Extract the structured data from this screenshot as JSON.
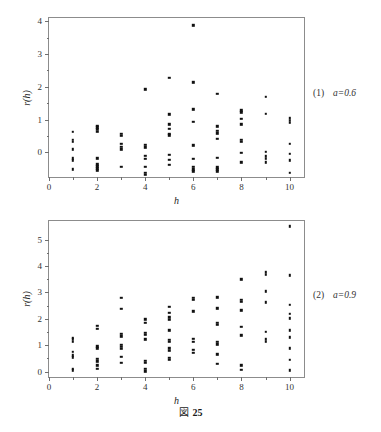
{
  "caption": {
    "prefix": "図",
    "number": "25"
  },
  "panels": [
    {
      "note_index": "(1)",
      "note_param": "a=0.6",
      "axis": {
        "xlabel": "h",
        "ylabel": "r(h)",
        "xticks": [
          "0",
          "2",
          "4",
          "6",
          "8",
          "10"
        ],
        "yticks": [
          "0",
          "1",
          "2",
          "3",
          "4"
        ]
      }
    },
    {
      "note_index": "(2)",
      "note_param": "a=0.9",
      "axis": {
        "xlabel": "h",
        "ylabel": "r(h)",
        "xticks": [
          "0",
          "2",
          "4",
          "6",
          "8",
          "10"
        ],
        "yticks": [
          "0",
          "1",
          "2",
          "3",
          "4",
          "5"
        ]
      }
    }
  ],
  "chart_data": [
    {
      "type": "scatter",
      "title": "",
      "subtitle": "(1)  a=0.6",
      "xlabel": "h",
      "ylabel": "r(h)",
      "xlim": [
        0,
        10.6
      ],
      "ylim": [
        -0.75,
        4.1
      ],
      "xticks": [
        0,
        2,
        4,
        6,
        8,
        10
      ],
      "yticks": [
        0,
        1,
        2,
        3,
        4
      ],
      "grid": false,
      "legend": null,
      "marker": "square",
      "marker_color": "#111111",
      "points": [
        {
          "x": 1,
          "y": 0.62
        },
        {
          "x": 1,
          "y": 0.38
        },
        {
          "x": 1,
          "y": 0.32
        },
        {
          "x": 1,
          "y": 0.1
        },
        {
          "x": 1,
          "y": -0.18
        },
        {
          "x": 1,
          "y": -0.24
        },
        {
          "x": 1,
          "y": -0.52
        },
        {
          "x": 2,
          "y": 0.82
        },
        {
          "x": 2,
          "y": 0.76
        },
        {
          "x": 2,
          "y": 0.7
        },
        {
          "x": 2,
          "y": 0.62
        },
        {
          "x": 2,
          "y": -0.18
        },
        {
          "x": 2,
          "y": -0.36
        },
        {
          "x": 2,
          "y": -0.42
        },
        {
          "x": 2,
          "y": -0.48
        },
        {
          "x": 2,
          "y": -0.54
        },
        {
          "x": 3,
          "y": 0.56
        },
        {
          "x": 3,
          "y": 0.5
        },
        {
          "x": 3,
          "y": 0.26
        },
        {
          "x": 3,
          "y": 0.18
        },
        {
          "x": 3,
          "y": 0.1
        },
        {
          "x": 3,
          "y": -0.44
        },
        {
          "x": 4,
          "y": 1.92
        },
        {
          "x": 4,
          "y": 0.24
        },
        {
          "x": 4,
          "y": 0.16
        },
        {
          "x": 4,
          "y": -0.1
        },
        {
          "x": 4,
          "y": -0.2
        },
        {
          "x": 4,
          "y": -0.44
        },
        {
          "x": 4,
          "y": -0.62
        },
        {
          "x": 4,
          "y": -0.68
        },
        {
          "x": 5,
          "y": 2.28
        },
        {
          "x": 5,
          "y": 1.16
        },
        {
          "x": 5,
          "y": 0.86
        },
        {
          "x": 5,
          "y": 0.72
        },
        {
          "x": 5,
          "y": 0.56
        },
        {
          "x": 5,
          "y": 0.52
        },
        {
          "x": 5,
          "y": -0.08
        },
        {
          "x": 5,
          "y": -0.22
        },
        {
          "x": 5,
          "y": -0.38
        },
        {
          "x": 6,
          "y": 3.88
        },
        {
          "x": 6,
          "y": 2.14
        },
        {
          "x": 6,
          "y": 1.32
        },
        {
          "x": 6,
          "y": 0.94
        },
        {
          "x": 6,
          "y": 0.22
        },
        {
          "x": 6,
          "y": -0.2
        },
        {
          "x": 6,
          "y": -0.44
        },
        {
          "x": 6,
          "y": -0.52
        },
        {
          "x": 6,
          "y": -0.58
        },
        {
          "x": 7,
          "y": 1.78
        },
        {
          "x": 7,
          "y": 0.8
        },
        {
          "x": 7,
          "y": 0.66
        },
        {
          "x": 7,
          "y": 0.58
        },
        {
          "x": 7,
          "y": 0.42
        },
        {
          "x": 7,
          "y": -0.16
        },
        {
          "x": 7,
          "y": -0.46
        },
        {
          "x": 7,
          "y": -0.52
        },
        {
          "x": 7,
          "y": -0.58
        },
        {
          "x": 8,
          "y": 1.28
        },
        {
          "x": 8,
          "y": 1.22
        },
        {
          "x": 8,
          "y": 1.02
        },
        {
          "x": 8,
          "y": 0.86
        },
        {
          "x": 8,
          "y": 0.38
        },
        {
          "x": 8,
          "y": 0.32
        },
        {
          "x": 8,
          "y": -0.02
        },
        {
          "x": 8,
          "y": -0.3
        },
        {
          "x": 9,
          "y": 1.7
        },
        {
          "x": 9,
          "y": 1.18
        },
        {
          "x": 9,
          "y": 0.02
        },
        {
          "x": 9,
          "y": -0.12
        },
        {
          "x": 9,
          "y": -0.2
        },
        {
          "x": 9,
          "y": -0.3
        },
        {
          "x": 10,
          "y": 1.04
        },
        {
          "x": 10,
          "y": 0.96
        },
        {
          "x": 10,
          "y": 0.9
        },
        {
          "x": 10,
          "y": 0.26
        },
        {
          "x": 10,
          "y": -0.04
        },
        {
          "x": 10,
          "y": -0.24
        },
        {
          "x": 10,
          "y": -0.62
        }
      ]
    },
    {
      "type": "scatter",
      "title": "",
      "subtitle": "(2)  a=0.9",
      "xlabel": "h",
      "ylabel": "r(h)",
      "xlim": [
        0,
        10.6
      ],
      "ylim": [
        -0.2,
        5.7
      ],
      "xticks": [
        0,
        2,
        4,
        6,
        8,
        10
      ],
      "yticks": [
        0,
        1,
        2,
        3,
        4,
        5
      ],
      "grid": false,
      "legend": null,
      "marker": "square",
      "marker_color": "#111111",
      "points": [
        {
          "x": 1,
          "y": 1.28
        },
        {
          "x": 1,
          "y": 1.22
        },
        {
          "x": 1,
          "y": 1.14
        },
        {
          "x": 1,
          "y": 0.76
        },
        {
          "x": 1,
          "y": 0.62
        },
        {
          "x": 1,
          "y": 0.54
        },
        {
          "x": 1,
          "y": 0.12
        },
        {
          "x": 1,
          "y": 0.06
        },
        {
          "x": 2,
          "y": 1.74
        },
        {
          "x": 2,
          "y": 1.62
        },
        {
          "x": 2,
          "y": 0.96
        },
        {
          "x": 2,
          "y": 0.88
        },
        {
          "x": 2,
          "y": 0.48
        },
        {
          "x": 2,
          "y": 0.4
        },
        {
          "x": 2,
          "y": 0.24
        },
        {
          "x": 2,
          "y": 0.12
        },
        {
          "x": 3,
          "y": 2.8
        },
        {
          "x": 3,
          "y": 2.38
        },
        {
          "x": 3,
          "y": 1.44
        },
        {
          "x": 3,
          "y": 1.34
        },
        {
          "x": 3,
          "y": 1.02
        },
        {
          "x": 3,
          "y": 0.94
        },
        {
          "x": 3,
          "y": 0.86
        },
        {
          "x": 3,
          "y": 0.56
        },
        {
          "x": 3,
          "y": 0.34
        },
        {
          "x": 4,
          "y": 1.98
        },
        {
          "x": 4,
          "y": 1.86
        },
        {
          "x": 4,
          "y": 1.48
        },
        {
          "x": 4,
          "y": 1.4
        },
        {
          "x": 4,
          "y": 1.22
        },
        {
          "x": 4,
          "y": 0.42
        },
        {
          "x": 4,
          "y": 0.34
        },
        {
          "x": 4,
          "y": 0.1
        },
        {
          "x": 4,
          "y": 0.02
        },
        {
          "x": 5,
          "y": 2.46
        },
        {
          "x": 5,
          "y": 2.22
        },
        {
          "x": 5,
          "y": 2.06
        },
        {
          "x": 5,
          "y": 1.96
        },
        {
          "x": 5,
          "y": 1.56
        },
        {
          "x": 5,
          "y": 1.2
        },
        {
          "x": 5,
          "y": 1.12
        },
        {
          "x": 5,
          "y": 0.88
        },
        {
          "x": 5,
          "y": 0.78
        },
        {
          "x": 5,
          "y": 0.52
        },
        {
          "x": 5,
          "y": 0.46
        },
        {
          "x": 6,
          "y": 2.8
        },
        {
          "x": 6,
          "y": 2.72
        },
        {
          "x": 6,
          "y": 2.28
        },
        {
          "x": 6,
          "y": 1.24
        },
        {
          "x": 6,
          "y": 1.14
        },
        {
          "x": 6,
          "y": 0.84
        },
        {
          "x": 6,
          "y": 0.72
        },
        {
          "x": 7,
          "y": 2.82
        },
        {
          "x": 7,
          "y": 2.4
        },
        {
          "x": 7,
          "y": 1.86
        },
        {
          "x": 7,
          "y": 1.78
        },
        {
          "x": 7,
          "y": 1.12
        },
        {
          "x": 7,
          "y": 1.04
        },
        {
          "x": 7,
          "y": 0.66
        },
        {
          "x": 7,
          "y": 0.3
        },
        {
          "x": 8,
          "y": 3.5
        },
        {
          "x": 8,
          "y": 2.72
        },
        {
          "x": 8,
          "y": 2.64
        },
        {
          "x": 8,
          "y": 2.32
        },
        {
          "x": 8,
          "y": 1.7
        },
        {
          "x": 8,
          "y": 1.38
        },
        {
          "x": 8,
          "y": 0.24
        },
        {
          "x": 8,
          "y": 0.08
        },
        {
          "x": 9,
          "y": 3.76
        },
        {
          "x": 9,
          "y": 3.66
        },
        {
          "x": 9,
          "y": 3.04
        },
        {
          "x": 9,
          "y": 2.62
        },
        {
          "x": 9,
          "y": 1.5
        },
        {
          "x": 9,
          "y": 1.22
        },
        {
          "x": 9,
          "y": 1.14
        },
        {
          "x": 10,
          "y": 5.5
        },
        {
          "x": 10,
          "y": 3.64
        },
        {
          "x": 10,
          "y": 2.52
        },
        {
          "x": 10,
          "y": 2.2
        },
        {
          "x": 10,
          "y": 2.02
        },
        {
          "x": 10,
          "y": 1.56
        },
        {
          "x": 10,
          "y": 1.3
        },
        {
          "x": 10,
          "y": 0.88
        },
        {
          "x": 10,
          "y": 0.46
        },
        {
          "x": 10,
          "y": 0.06
        }
      ]
    }
  ]
}
